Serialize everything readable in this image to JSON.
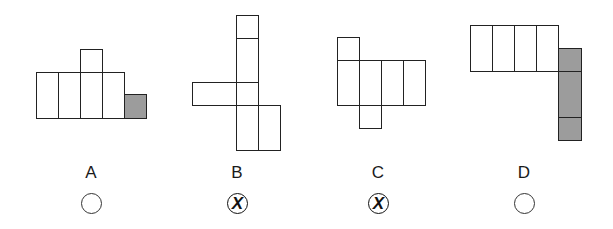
{
  "options": [
    {
      "label": "A",
      "state": "unmarked",
      "figure": {
        "cells": [
          {
            "x": 36,
            "y": 72,
            "w": 22,
            "h": 46,
            "shaded": false
          },
          {
            "x": 58,
            "y": 72,
            "w": 22,
            "h": 46,
            "shaded": false
          },
          {
            "x": 80,
            "y": 72,
            "w": 22,
            "h": 46,
            "shaded": false
          },
          {
            "x": 102,
            "y": 72,
            "w": 22,
            "h": 46,
            "shaded": false
          },
          {
            "x": 80,
            "y": 49,
            "w": 22,
            "h": 23,
            "shaded": false
          },
          {
            "x": 124,
            "y": 94,
            "w": 22,
            "h": 24,
            "shaded": true
          }
        ]
      },
      "label_pos": {
        "x": 76,
        "y": 163
      },
      "radio_pos": {
        "x": 81,
        "y": 193
      }
    },
    {
      "label": "B",
      "state": "crossed",
      "mark": "X",
      "figure": {
        "cells": [
          {
            "x": 236,
            "y": 15,
            "w": 22,
            "h": 23,
            "shaded": false
          },
          {
            "x": 236,
            "y": 38,
            "w": 22,
            "h": 44,
            "shaded": false
          },
          {
            "x": 236,
            "y": 82,
            "w": 22,
            "h": 23,
            "shaded": false
          },
          {
            "x": 236,
            "y": 105,
            "w": 22,
            "h": 45,
            "shaded": false
          },
          {
            "x": 192,
            "y": 82,
            "w": 44,
            "h": 23,
            "shaded": false
          },
          {
            "x": 258,
            "y": 105,
            "w": 22,
            "h": 45,
            "shaded": false
          }
        ]
      },
      "label_pos": {
        "x": 222,
        "y": 163
      },
      "radio_pos": {
        "x": 227,
        "y": 193
      }
    },
    {
      "label": "C",
      "state": "crossed",
      "mark": "X",
      "figure": {
        "cells": [
          {
            "x": 337,
            "y": 37,
            "w": 22,
            "h": 23,
            "shaded": false
          },
          {
            "x": 337,
            "y": 60,
            "w": 22,
            "h": 45,
            "shaded": false
          },
          {
            "x": 359,
            "y": 60,
            "w": 22,
            "h": 45,
            "shaded": false
          },
          {
            "x": 381,
            "y": 60,
            "w": 22,
            "h": 45,
            "shaded": false
          },
          {
            "x": 403,
            "y": 60,
            "w": 22,
            "h": 45,
            "shaded": false
          },
          {
            "x": 359,
            "y": 105,
            "w": 22,
            "h": 23,
            "shaded": false
          }
        ]
      },
      "label_pos": {
        "x": 363,
        "y": 163
      },
      "radio_pos": {
        "x": 368,
        "y": 193
      }
    },
    {
      "label": "D",
      "state": "unmarked",
      "figure": {
        "cells": [
          {
            "x": 470,
            "y": 25,
            "w": 22,
            "h": 46,
            "shaded": false
          },
          {
            "x": 492,
            "y": 25,
            "w": 22,
            "h": 46,
            "shaded": false
          },
          {
            "x": 514,
            "y": 25,
            "w": 22,
            "h": 46,
            "shaded": false
          },
          {
            "x": 536,
            "y": 25,
            "w": 22,
            "h": 46,
            "shaded": false
          },
          {
            "x": 558,
            "y": 48,
            "w": 23,
            "h": 23,
            "shaded": true
          },
          {
            "x": 558,
            "y": 71,
            "w": 23,
            "h": 46,
            "shaded": true
          },
          {
            "x": 558,
            "y": 117,
            "w": 23,
            "h": 23,
            "shaded": true
          }
        ]
      },
      "label_pos": {
        "x": 509,
        "y": 163
      },
      "radio_pos": {
        "x": 514,
        "y": 193
      }
    }
  ],
  "colors": {
    "outline": "#222222",
    "shaded_fill": "#9c9c9c",
    "background": "#ffffff"
  }
}
